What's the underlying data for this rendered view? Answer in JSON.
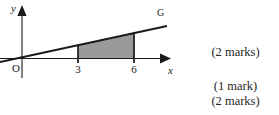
{
  "figure": {
    "axes": {
      "x_axis_label": "x",
      "y_axis_label": "y",
      "origin_label": "O"
    },
    "tick_labels": [
      "3",
      "6"
    ],
    "line_label": "G",
    "shaded_region": {
      "fill_color": "#9a9a9a",
      "stroke_color": "#1a1a1a",
      "x_from": "3",
      "x_to": "6"
    },
    "stroke_color": "#1a1a1a"
  },
  "marks": {
    "lines": [
      "(2 marks)",
      "(1 mark)",
      "(2 marks)"
    ]
  }
}
